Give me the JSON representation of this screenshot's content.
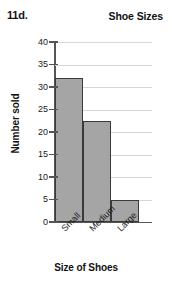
{
  "header": {
    "question_number": "11d.",
    "title": "Shoe Sizes"
  },
  "axis_titles": {
    "x": "Size of Shoes",
    "y": "Number sold"
  },
  "colors": {
    "bar_fill": "#a5a5a5",
    "bar_stroke": "#3a3a3a",
    "gridline": "#d6d6d6",
    "axis": "#555555",
    "text": "#1a1a1a",
    "background": "#ffffff"
  },
  "yticks": [
    {
      "label": "0",
      "value": 0
    },
    {
      "label": "5",
      "value": 5
    },
    {
      "label": "10",
      "value": 10
    },
    {
      "label": "15",
      "value": 15
    },
    {
      "label": "20",
      "value": 20
    },
    {
      "label": "25",
      "value": 25
    },
    {
      "label": "30",
      "value": 30
    },
    {
      "label": "35",
      "value": 35
    },
    {
      "label": "40",
      "value": 40
    }
  ],
  "bars": [
    {
      "label": "Small",
      "value": 32
    },
    {
      "label": "Medium",
      "value": 22.5
    },
    {
      "label": "Large",
      "value": 5
    }
  ],
  "chart_data": {
    "type": "bar",
    "title": "Shoe Sizes",
    "categories": [
      "Small",
      "Medium",
      "Large"
    ],
    "values": [
      32,
      22.5,
      5
    ],
    "xlabel": "Size of Shoes",
    "ylabel": "Number sold",
    "ylim": [
      0,
      40
    ],
    "ytick_step": 5,
    "yticks": [
      0,
      5,
      10,
      15,
      20,
      25,
      30,
      35,
      40
    ],
    "grid": true,
    "grid_axis": "y",
    "legend": false,
    "bars_contiguous": true,
    "tick_label_rotation": -45,
    "annotation": "11d."
  }
}
